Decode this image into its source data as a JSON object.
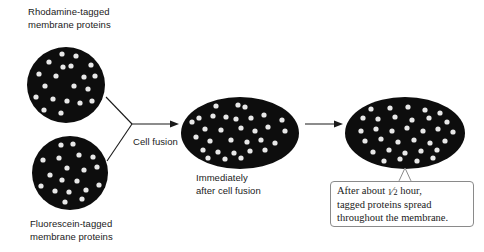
{
  "figure": {
    "background_color": "#ffffff",
    "cell_color": "#0d0d0d",
    "protein_dot_color": "#e8e8e8",
    "line_color": "#1a1a1a",
    "caption_border_color": "#8a8a8a"
  },
  "labels": {
    "rhodamine": "Rhodamine-tagged\nmembrane proteins",
    "fluorescein": "Fluorescein-tagged\nmembrane proteins",
    "cell_fusion": "Cell fusion",
    "immediately": "Immediately\nafter cell fusion"
  },
  "caption": {
    "line1_before_fraction": "After about ",
    "fraction_numerator": "1",
    "fraction_denominator": "2",
    "line1_after_fraction": " hour,",
    "line2": "tagged proteins spread",
    "line3": "throughout the membrane."
  },
  "cells": [
    {
      "name": "rhodamine-cell",
      "shape": "circle",
      "cx": 66,
      "cy": 85,
      "rx": 39,
      "ry": 38,
      "dots": [
        [
          62,
          54
        ],
        [
          76,
          56
        ],
        [
          49,
          62
        ],
        [
          63,
          67
        ],
        [
          71,
          66
        ],
        [
          91,
          65
        ],
        [
          39,
          74
        ],
        [
          56,
          76
        ],
        [
          84,
          77
        ],
        [
          95,
          76
        ],
        [
          45,
          86
        ],
        [
          74,
          86
        ],
        [
          88,
          89
        ],
        [
          36,
          97
        ],
        [
          53,
          99
        ],
        [
          67,
          101
        ],
        [
          80,
          103
        ],
        [
          44,
          110
        ],
        [
          61,
          113
        ],
        [
          92,
          101
        ]
      ]
    },
    {
      "name": "fluorescein-cell",
      "shape": "circle",
      "cx": 70,
      "cy": 173,
      "rx": 38,
      "ry": 37,
      "dots": [
        [
          61,
          145
        ],
        [
          73,
          144
        ],
        [
          43,
          160
        ],
        [
          59,
          158
        ],
        [
          79,
          155
        ],
        [
          93,
          157
        ],
        [
          67,
          168
        ],
        [
          84,
          170
        ],
        [
          97,
          167
        ],
        [
          50,
          175
        ],
        [
          62,
          180
        ],
        [
          77,
          181
        ],
        [
          41,
          186
        ],
        [
          55,
          191
        ],
        [
          69,
          192
        ],
        [
          86,
          190
        ],
        [
          99,
          185
        ],
        [
          49,
          200
        ],
        [
          65,
          202
        ],
        [
          82,
          199
        ]
      ]
    },
    {
      "name": "immediately-after-fusion-cell",
      "shape": "ellipse",
      "cx": 240,
      "cy": 133,
      "rx": 59,
      "ry": 36,
      "dots": [
        [
          203,
          101
        ],
        [
          230,
          100
        ],
        [
          249,
          89
        ],
        [
          272,
          103
        ],
        [
          216,
          106
        ],
        [
          238,
          105
        ],
        [
          245,
          107
        ],
        [
          257,
          101
        ],
        [
          190,
          108
        ],
        [
          276,
          109
        ],
        [
          290,
          105
        ],
        [
          199,
          118
        ],
        [
          213,
          116
        ],
        [
          226,
          117
        ],
        [
          236,
          119
        ],
        [
          251,
          118
        ],
        [
          264,
          115
        ],
        [
          282,
          120
        ],
        [
          192,
          122
        ],
        [
          205,
          129
        ],
        [
          221,
          130
        ],
        [
          241,
          128
        ],
        [
          255,
          131
        ],
        [
          268,
          127
        ],
        [
          285,
          131
        ],
        [
          196,
          137
        ],
        [
          210,
          141
        ],
        [
          231,
          140
        ],
        [
          247,
          142
        ],
        [
          261,
          140
        ],
        [
          275,
          143
        ],
        [
          203,
          150
        ],
        [
          218,
          152
        ],
        [
          234,
          153
        ],
        [
          250,
          151
        ],
        [
          265,
          150
        ],
        [
          208,
          158
        ],
        [
          225,
          159
        ],
        [
          241,
          158
        ]
      ]
    },
    {
      "name": "after-half-hour-cell",
      "shape": "ellipse",
      "cx": 405,
      "cy": 133,
      "rx": 60,
      "ry": 36,
      "dots": [
        [
          366,
          101
        ],
        [
          385,
          97
        ],
        [
          403,
          96
        ],
        [
          422,
          100
        ],
        [
          443,
          102
        ],
        [
          355,
          110
        ],
        [
          371,
          109
        ],
        [
          390,
          108
        ],
        [
          408,
          107
        ],
        [
          425,
          110
        ],
        [
          440,
          113
        ],
        [
          456,
          112
        ],
        [
          349,
          120
        ],
        [
          363,
          118
        ],
        [
          378,
          119
        ],
        [
          395,
          117
        ],
        [
          412,
          120
        ],
        [
          429,
          118
        ],
        [
          447,
          122
        ],
        [
          460,
          121
        ],
        [
          347,
          130
        ],
        [
          361,
          131
        ],
        [
          376,
          129
        ],
        [
          392,
          131
        ],
        [
          407,
          128
        ],
        [
          423,
          131
        ],
        [
          438,
          129
        ],
        [
          453,
          132
        ],
        [
          350,
          140
        ],
        [
          365,
          141
        ],
        [
          381,
          139
        ],
        [
          398,
          142
        ],
        [
          414,
          140
        ],
        [
          430,
          143
        ],
        [
          445,
          141
        ],
        [
          459,
          140
        ],
        [
          357,
          151
        ],
        [
          373,
          152
        ],
        [
          389,
          150
        ],
        [
          405,
          153
        ],
        [
          421,
          151
        ],
        [
          437,
          150
        ],
        [
          452,
          152
        ],
        [
          368,
          160
        ],
        [
          384,
          161
        ],
        [
          400,
          159
        ],
        [
          417,
          161
        ],
        [
          433,
          158
        ]
      ]
    }
  ],
  "arrows": [
    {
      "name": "fusion-merge-arrow",
      "type": "y-merge"
    },
    {
      "name": "diffusion-arrow",
      "type": "straight"
    }
  ],
  "caption_pointer": {
    "name": "caption-pointer",
    "tip_x": 405,
    "tip_y": 168
  }
}
